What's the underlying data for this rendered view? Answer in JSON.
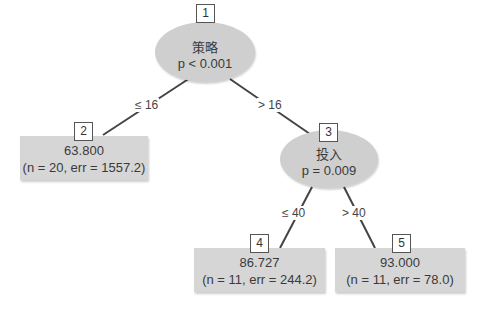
{
  "diagram": {
    "type": "regression-tree",
    "colors": {
      "node_fill": "#cfcfcf",
      "leaf_fill": "#d6d6d6",
      "edge": "#444444",
      "text": "#3a3a3a"
    },
    "nodes": [
      {
        "id": "1",
        "kind": "inner",
        "variable": "策略",
        "stat": "p < 0.001"
      },
      {
        "id": "2",
        "kind": "leaf",
        "value": "63.800",
        "detail": "(n = 20, err = 1557.2)"
      },
      {
        "id": "3",
        "kind": "inner",
        "variable": "投入",
        "stat": "p = 0.009"
      },
      {
        "id": "4",
        "kind": "leaf",
        "value": "86.727",
        "detail": "(n = 11, err = 244.2)"
      },
      {
        "id": "5",
        "kind": "leaf",
        "value": "93.000",
        "detail": "(n = 11, err = 78.0)"
      }
    ],
    "edges": [
      {
        "from": "1",
        "to": "2",
        "label": "≤ 16"
      },
      {
        "from": "1",
        "to": "3",
        "label": "> 16"
      },
      {
        "from": "3",
        "to": "4",
        "label": "≤ 40"
      },
      {
        "from": "3",
        "to": "5",
        "label": "> 40"
      }
    ]
  }
}
